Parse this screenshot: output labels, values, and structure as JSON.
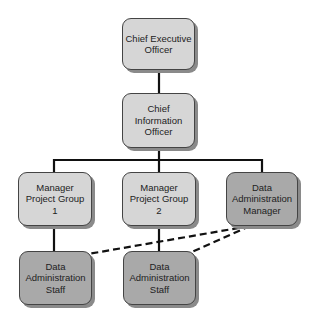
{
  "diagram": {
    "type": "org-chart",
    "colors": {
      "light_box": "#d6d6d6",
      "dark_box": "#a9a9a9",
      "line": "#111111",
      "shadow": "#8a8a8a"
    },
    "nodes": [
      {
        "id": "ceo",
        "label": "Chief Executive\nOfficer",
        "style": "light"
      },
      {
        "id": "cio",
        "label": "Chief\nInformation\nOfficer",
        "style": "light"
      },
      {
        "id": "mpg1",
        "label": "Manager\nProject Group\n1",
        "style": "light"
      },
      {
        "id": "mpg2",
        "label": "Manager\nProject Group\n2",
        "style": "light"
      },
      {
        "id": "dam",
        "label": "Data\nAdministration\nManager",
        "style": "dark"
      },
      {
        "id": "das1",
        "label": "Data\nAdministration\nStaff",
        "style": "dark"
      },
      {
        "id": "das2",
        "label": "Data\nAdministration\nStaff",
        "style": "dark"
      }
    ],
    "edges": [
      {
        "from": "ceo",
        "to": "cio",
        "style": "solid"
      },
      {
        "from": "cio",
        "to": "mpg1",
        "style": "solid"
      },
      {
        "from": "cio",
        "to": "mpg2",
        "style": "solid"
      },
      {
        "from": "cio",
        "to": "dam",
        "style": "solid"
      },
      {
        "from": "mpg1",
        "to": "das1",
        "style": "solid"
      },
      {
        "from": "mpg2",
        "to": "das2",
        "style": "solid"
      },
      {
        "from": "dam",
        "to": "das1",
        "style": "dashed"
      },
      {
        "from": "dam",
        "to": "das2",
        "style": "dashed"
      }
    ]
  }
}
